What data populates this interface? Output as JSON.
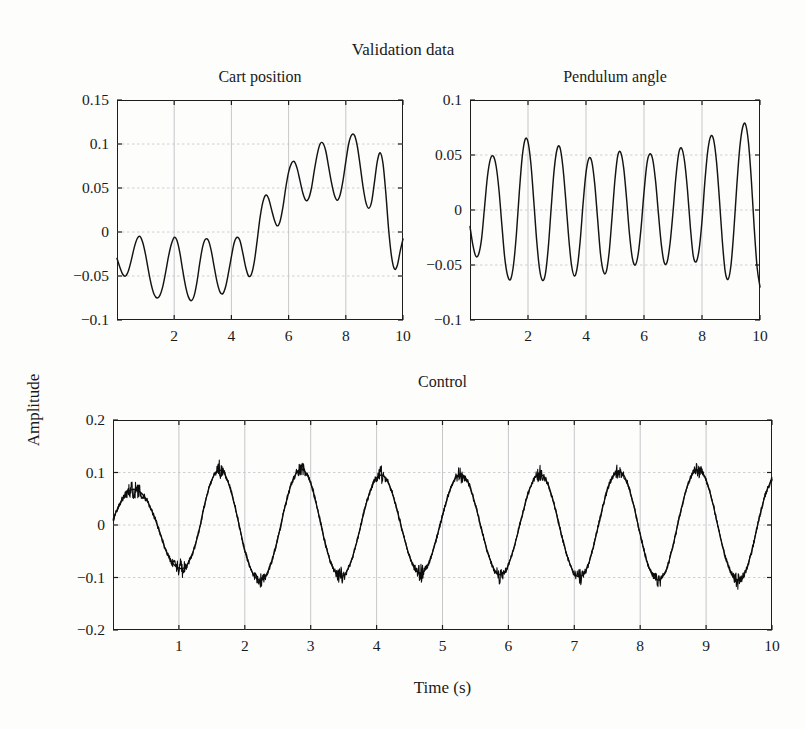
{
  "figure": {
    "page_bleed_text": "",
    "main_title": "Validation data",
    "ylabel": "Amplitude",
    "xlabel": "Time (s)"
  },
  "chart_data": [
    {
      "type": "line",
      "name": "cart-position",
      "title": "Cart position",
      "xlabel": "Time (s)",
      "ylabel": "Amplitude",
      "xlim": [
        0,
        10
      ],
      "ylim": [
        -0.1,
        0.15
      ],
      "xticks": [
        2,
        4,
        6,
        8,
        10
      ],
      "xticklabels": [
        "2",
        "4",
        "6",
        "8",
        "10"
      ],
      "yticks": [
        -0.1,
        -0.05,
        0,
        0.05,
        0.1,
        0.15
      ],
      "yticklabels": [
        "−0.1",
        "−0.05",
        "0",
        "0.05",
        "0.1",
        "0.15"
      ],
      "grid": true,
      "legend": "none",
      "description": "Oscillation near -0.035 mean for t<4.2 s, step up to mean +0.065 for 4.5<t<9 s, then drop back toward -0.02",
      "x": [
        0.0,
        0.1,
        0.2,
        0.3,
        0.4,
        0.5,
        0.6,
        0.7,
        0.8,
        0.9,
        1.0,
        1.1,
        1.2,
        1.3,
        1.4,
        1.5,
        1.6,
        1.7,
        1.8,
        1.9,
        2.0,
        2.1,
        2.2,
        2.3,
        2.4,
        2.5,
        2.6,
        2.7,
        2.8,
        2.9,
        3.0,
        3.1,
        3.2,
        3.3,
        3.4,
        3.5,
        3.6,
        3.7,
        3.8,
        3.9,
        4.0,
        4.1,
        4.2,
        4.3,
        4.4,
        4.5,
        4.6,
        4.7,
        4.8,
        4.9,
        5.0,
        5.1,
        5.2,
        5.3,
        5.4,
        5.5,
        5.6,
        5.7,
        5.8,
        5.9,
        6.0,
        6.1,
        6.2,
        6.3,
        6.4,
        6.5,
        6.6,
        6.7,
        6.8,
        6.9,
        7.0,
        7.1,
        7.2,
        7.3,
        7.4,
        7.5,
        7.6,
        7.7,
        7.8,
        7.9,
        8.0,
        8.1,
        8.2,
        8.3,
        8.4,
        8.5,
        8.6,
        8.7,
        8.8,
        8.9,
        9.0,
        9.1,
        9.2,
        9.3,
        9.4,
        9.5,
        9.6,
        9.7,
        9.8,
        9.9,
        10.0
      ],
      "y": [
        -0.03,
        -0.04,
        -0.048,
        -0.05,
        -0.044,
        -0.032,
        -0.018,
        -0.008,
        -0.005,
        -0.012,
        -0.026,
        -0.044,
        -0.06,
        -0.071,
        -0.075,
        -0.072,
        -0.062,
        -0.046,
        -0.028,
        -0.014,
        -0.006,
        -0.01,
        -0.024,
        -0.044,
        -0.062,
        -0.074,
        -0.078,
        -0.072,
        -0.056,
        -0.034,
        -0.016,
        -0.008,
        -0.01,
        -0.022,
        -0.04,
        -0.057,
        -0.068,
        -0.07,
        -0.062,
        -0.046,
        -0.028,
        -0.012,
        -0.006,
        -0.01,
        -0.024,
        -0.04,
        -0.05,
        -0.048,
        -0.034,
        -0.01,
        0.016,
        0.034,
        0.042,
        0.038,
        0.026,
        0.014,
        0.007,
        0.012,
        0.028,
        0.05,
        0.068,
        0.078,
        0.08,
        0.072,
        0.058,
        0.044,
        0.036,
        0.038,
        0.05,
        0.07,
        0.088,
        0.1,
        0.101,
        0.092,
        0.074,
        0.056,
        0.042,
        0.036,
        0.042,
        0.058,
        0.08,
        0.1,
        0.11,
        0.11,
        0.098,
        0.076,
        0.052,
        0.034,
        0.027,
        0.034,
        0.056,
        0.08,
        0.09,
        0.078,
        0.044,
        0.002,
        -0.028,
        -0.042,
        -0.038,
        -0.022,
        -0.008,
        0.0,
        -0.004,
        -0.022
      ]
    },
    {
      "type": "line",
      "name": "pendulum-angle",
      "title": "Pendulum angle",
      "xlabel": "Time (s)",
      "ylabel": "Amplitude",
      "xlim": [
        0,
        10
      ],
      "ylim": [
        -0.1,
        0.1
      ],
      "xticks": [
        2,
        4,
        6,
        8,
        10
      ],
      "xticklabels": [
        "2",
        "4",
        "6",
        "8",
        "10"
      ],
      "yticks": [
        -0.1,
        -0.05,
        0,
        0.05,
        0.1
      ],
      "yticklabels": [
        "−0.1",
        "−0.05",
        "0",
        "0.05",
        "0.1"
      ],
      "grid": true,
      "legend": "none",
      "description": "Roughly 10 oscillation cycles, zero mean, peak amplitude growing from ~0.05 to ~0.08 near t=8.7 s",
      "x": [
        0.0,
        0.1,
        0.2,
        0.3,
        0.4,
        0.5,
        0.6,
        0.7,
        0.8,
        0.9,
        1.0,
        1.1,
        1.2,
        1.3,
        1.4,
        1.5,
        1.6,
        1.7,
        1.8,
        1.9,
        2.0,
        2.1,
        2.2,
        2.3,
        2.4,
        2.5,
        2.6,
        2.7,
        2.8,
        2.9,
        3.0,
        3.1,
        3.2,
        3.3,
        3.4,
        3.5,
        3.6,
        3.7,
        3.8,
        3.9,
        4.0,
        4.1,
        4.2,
        4.3,
        4.4,
        4.5,
        4.6,
        4.7,
        4.8,
        4.9,
        5.0,
        5.1,
        5.2,
        5.3,
        5.4,
        5.5,
        5.6,
        5.7,
        5.8,
        5.9,
        6.0,
        6.1,
        6.2,
        6.3,
        6.4,
        6.5,
        6.6,
        6.7,
        6.8,
        6.9,
        7.0,
        7.1,
        7.2,
        7.3,
        7.4,
        7.5,
        7.6,
        7.7,
        7.8,
        7.9,
        8.0,
        8.1,
        8.2,
        8.3,
        8.4,
        8.5,
        8.6,
        8.7,
        8.8,
        8.9,
        9.0,
        9.1,
        9.2,
        9.3,
        9.4,
        9.5,
        9.6,
        9.7,
        9.8,
        9.9,
        10.0
      ],
      "y": [
        -0.015,
        -0.032,
        -0.042,
        -0.04,
        -0.026,
        0.002,
        0.03,
        0.046,
        0.049,
        0.04,
        0.018,
        -0.014,
        -0.044,
        -0.06,
        -0.063,
        -0.05,
        -0.022,
        0.016,
        0.048,
        0.064,
        0.062,
        0.042,
        0.008,
        -0.028,
        -0.054,
        -0.064,
        -0.058,
        -0.034,
        0.002,
        0.036,
        0.055,
        0.057,
        0.04,
        0.01,
        -0.024,
        -0.05,
        -0.06,
        -0.052,
        -0.028,
        0.006,
        0.034,
        0.047,
        0.044,
        0.024,
        -0.008,
        -0.04,
        -0.056,
        -0.056,
        -0.038,
        -0.006,
        0.028,
        0.05,
        0.052,
        0.038,
        0.01,
        -0.022,
        -0.044,
        -0.05,
        -0.04,
        -0.016,
        0.016,
        0.042,
        0.051,
        0.046,
        0.026,
        -0.004,
        -0.032,
        -0.048,
        -0.047,
        -0.03,
        -0.002,
        0.03,
        0.052,
        0.056,
        0.044,
        0.018,
        -0.016,
        -0.042,
        -0.047,
        -0.036,
        -0.01,
        0.026,
        0.054,
        0.067,
        0.064,
        0.044,
        0.01,
        -0.028,
        -0.056,
        -0.063,
        -0.05,
        -0.018,
        0.022,
        0.056,
        0.075,
        0.078,
        0.062,
        0.028,
        -0.016,
        -0.052,
        -0.07,
        -0.068
      ]
    },
    {
      "type": "line",
      "name": "control",
      "title": "Control",
      "xlabel": "Time (s)",
      "ylabel": "Amplitude",
      "xlim": [
        0,
        10
      ],
      "ylim": [
        -0.2,
        0.2
      ],
      "xticks": [
        1,
        2,
        3,
        4,
        5,
        6,
        7,
        8,
        9,
        10
      ],
      "xticklabels": [
        "1",
        "2",
        "3",
        "4",
        "5",
        "6",
        "7",
        "8",
        "9",
        "10"
      ],
      "yticks": [
        -0.2,
        -0.1,
        0,
        0.1,
        0.2
      ],
      "yticklabels": [
        "−0.2",
        "−0.1",
        "0",
        "0.1",
        "0.2"
      ],
      "grid": true,
      "legend": "none",
      "description": "Approximately 10 cycles of a ~1 Hz sinusoid, peak near +0.10 and trough near -0.10, overlaid with heavy high-frequency dither/chatter that is widest at the extrema",
      "frequency_hz": 1.0,
      "amplitude": 0.095,
      "noise_band": 0.022,
      "x": [
        0.0,
        0.1,
        0.2,
        0.3,
        0.4,
        0.5,
        0.6,
        0.7,
        0.8,
        0.9,
        1.0,
        1.1,
        1.2,
        1.3,
        1.4,
        1.5,
        1.6,
        1.7,
        1.8,
        1.9,
        2.0,
        2.1,
        2.2,
        2.3,
        2.4,
        2.5,
        2.6,
        2.7,
        2.8,
        2.9,
        3.0,
        3.1,
        3.2,
        3.3,
        3.4,
        3.5,
        3.6,
        3.7,
        3.8,
        3.9,
        4.0,
        4.1,
        4.2,
        4.3,
        4.4,
        4.5,
        4.6,
        4.7,
        4.8,
        4.9,
        5.0,
        5.1,
        5.2,
        5.3,
        5.4,
        5.5,
        5.6,
        5.7,
        5.8,
        5.9,
        6.0,
        6.1,
        6.2,
        6.3,
        6.4,
        6.5,
        6.6,
        6.7,
        6.8,
        6.9,
        7.0,
        7.1,
        7.2,
        7.3,
        7.4,
        7.5,
        7.6,
        7.7,
        7.8,
        7.9,
        8.0,
        8.1,
        8.2,
        8.3,
        8.4,
        8.5,
        8.6,
        8.7,
        8.8,
        8.9,
        9.0,
        9.1,
        9.2,
        9.3,
        9.4,
        9.5,
        9.6,
        9.7,
        9.8,
        9.9,
        10.0
      ],
      "y": [
        0.01,
        0.04,
        0.06,
        0.068,
        0.064,
        0.05,
        0.024,
        -0.01,
        -0.048,
        -0.072,
        -0.082,
        -0.08,
        -0.056,
        -0.014,
        0.044,
        0.086,
        0.104,
        0.096,
        0.06,
        0.008,
        -0.048,
        -0.086,
        -0.104,
        -0.1,
        -0.072,
        -0.026,
        0.03,
        0.076,
        0.102,
        0.104,
        0.08,
        0.032,
        -0.024,
        -0.07,
        -0.094,
        -0.096,
        -0.074,
        -0.032,
        0.02,
        0.064,
        0.09,
        0.094,
        0.074,
        0.034,
        -0.016,
        -0.06,
        -0.086,
        -0.09,
        -0.07,
        -0.03,
        0.018,
        0.062,
        0.09,
        0.096,
        0.078,
        0.038,
        -0.012,
        -0.058,
        -0.088,
        -0.094,
        -0.076,
        -0.036,
        0.014,
        0.06,
        0.09,
        0.096,
        0.078,
        0.036,
        -0.016,
        -0.062,
        -0.092,
        -0.098,
        -0.08,
        -0.036,
        0.018,
        0.066,
        0.096,
        0.102,
        0.082,
        0.038,
        -0.018,
        -0.068,
        -0.098,
        -0.104,
        -0.084,
        -0.038,
        0.018,
        0.068,
        0.098,
        0.104,
        0.086,
        0.042,
        -0.014,
        -0.064,
        -0.096,
        -0.104,
        -0.088,
        -0.046,
        0.01,
        0.058,
        0.088
      ]
    }
  ]
}
